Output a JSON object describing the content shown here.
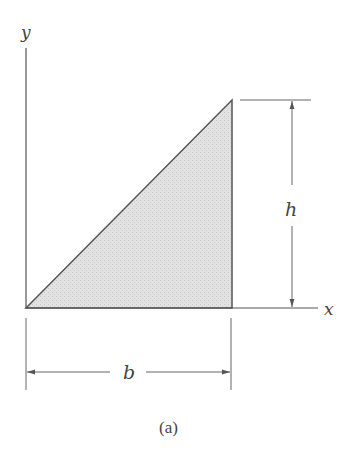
{
  "figure": {
    "caption": "(a)",
    "axes": {
      "x_label": "x",
      "y_label": "y"
    },
    "shape": {
      "type": "right-triangle",
      "fill": "#dcdcdc",
      "stroke": "#555555"
    },
    "dimensions": {
      "base_label": "b",
      "height_label": "h"
    }
  }
}
